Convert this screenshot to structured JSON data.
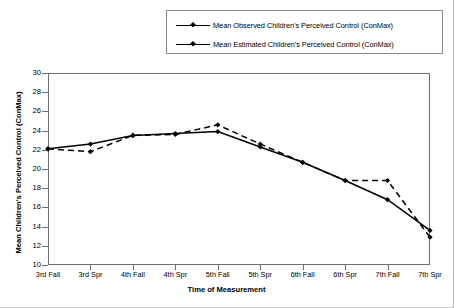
{
  "chart_data": {
    "type": "line",
    "title": "",
    "xlabel": "Time of Measurement",
    "ylabel": "Mean Children's Perceived Control (ConMax)",
    "categories": [
      "3rd Fall",
      "3rd Spr",
      "4th Fall",
      "4th Spr",
      "5th Fall",
      "5th Spr",
      "6th Fall",
      "6th Spr",
      "7th Fall",
      "7th Spr"
    ],
    "ylim": [
      10,
      30
    ],
    "ytick_step": 2,
    "yticks": [
      10,
      12,
      14,
      16,
      18,
      20,
      22,
      24,
      26,
      28,
      30
    ],
    "grid": false,
    "legend_position": "top",
    "series": [
      {
        "name": "Mean Observed Children's Perceived Control (ConMax)",
        "style": "dashed",
        "marker": "diamond",
        "color": "#000000",
        "values": [
          22.1,
          21.8,
          23.5,
          23.6,
          24.6,
          22.6,
          20.7,
          18.8,
          18.8,
          12.9
        ]
      },
      {
        "name": "Mean Estimated Children's Perceived Control (ConMax)",
        "style": "solid",
        "marker": "diamond",
        "color": "#000000",
        "values": [
          22.1,
          22.6,
          23.5,
          23.7,
          23.9,
          22.3,
          20.7,
          18.8,
          16.8,
          13.6
        ]
      }
    ]
  },
  "legend": {
    "items": [
      {
        "label": "Mean Observed Children's Perceived Control (ConMax)"
      },
      {
        "label": "Mean Estimated Children's Perceived Control (ConMax)"
      }
    ]
  }
}
